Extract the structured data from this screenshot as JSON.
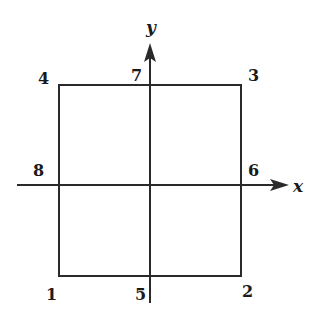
{
  "diagram": {
    "axes": {
      "x_label": "x",
      "y_label": "y"
    },
    "square": {
      "left": 59,
      "right": 241,
      "top": 85,
      "bottom": 276
    },
    "nodes": [
      {
        "id": "1",
        "label": "1",
        "position": "bottom-left corner",
        "x": 52,
        "y": 299
      },
      {
        "id": "2",
        "label": "2",
        "position": "bottom-right corner",
        "x": 247,
        "y": 296
      },
      {
        "id": "3",
        "label": "3",
        "position": "top-right corner",
        "x": 252,
        "y": 81
      },
      {
        "id": "4",
        "label": "4",
        "position": "top-left corner",
        "x": 45,
        "y": 84
      },
      {
        "id": "5",
        "label": "5",
        "position": "bottom midpoint",
        "x": 138,
        "y": 298
      },
      {
        "id": "6",
        "label": "6",
        "position": "right midpoint",
        "x": 252,
        "y": 176
      },
      {
        "id": "7",
        "label": "7",
        "position": "top midpoint",
        "x": 134,
        "y": 81
      },
      {
        "id": "8",
        "label": "8",
        "position": "left midpoint",
        "x": 36,
        "y": 175
      }
    ],
    "stroke_color": "#2a2a2a"
  }
}
